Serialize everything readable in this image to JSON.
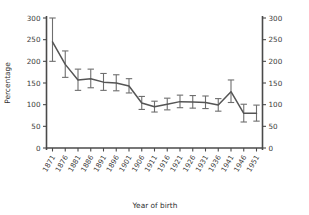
{
  "chart_data": {
    "type": "line",
    "title": "",
    "xlabel": "Year of birth",
    "ylabel": "Percentage",
    "xlim": [
      1869,
      1953
    ],
    "ylim": [
      0,
      300
    ],
    "yticks": [
      0,
      50,
      100,
      150,
      200,
      250,
      300
    ],
    "ytick_labels": [
      "0",
      "50",
      "100",
      "150",
      "200",
      "250",
      "300"
    ],
    "y_axis_right": {
      "ticks": [
        0,
        50,
        100,
        150,
        200,
        250,
        300
      ],
      "labels": [
        "0",
        "50",
        "100",
        "150",
        "200",
        "250",
        "300"
      ]
    },
    "grid": false,
    "legend": null,
    "categories": [
      "1871",
      "1876",
      "1881",
      "1886",
      "1891",
      "1896",
      "1901",
      "1906",
      "1911",
      "1916",
      "1921",
      "1926",
      "1931",
      "1936",
      "1941",
      "1946",
      "1951"
    ],
    "x": [
      1871,
      1876,
      1881,
      1886,
      1891,
      1896,
      1901,
      1906,
      1911,
      1916,
      1921,
      1926,
      1931,
      1936,
      1941,
      1946,
      1951
    ],
    "values": [
      245,
      193,
      157,
      160,
      152,
      150,
      143,
      104,
      95,
      101,
      107,
      106,
      105,
      99,
      130,
      80,
      80
    ],
    "error_low": [
      200,
      163,
      133,
      139,
      133,
      132,
      127,
      89,
      83,
      88,
      93,
      92,
      91,
      85,
      105,
      60,
      62
    ],
    "error_high": [
      300,
      224,
      182,
      182,
      172,
      169,
      160,
      119,
      108,
      115,
      122,
      121,
      120,
      114,
      157,
      101,
      99
    ],
    "series": [
      {
        "name": "percentage",
        "values": [
          245,
          193,
          157,
          160,
          152,
          150,
          143,
          104,
          95,
          101,
          107,
          106,
          105,
          99,
          130,
          80,
          80
        ]
      }
    ],
    "colors": {
      "line": "#555555",
      "errorbar": "#6e6e6e",
      "axis": "#4a4a4a",
      "text": "#3a3a3a",
      "background": "#ffffff"
    }
  }
}
